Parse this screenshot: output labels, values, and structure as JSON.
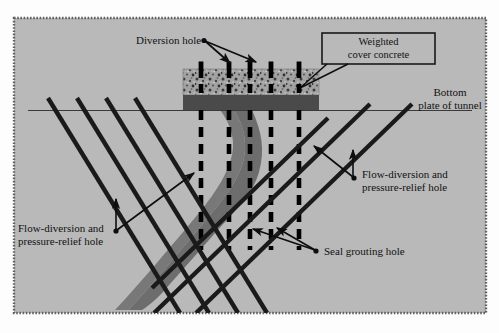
{
  "figure": {
    "background_color": "#b9b9b9",
    "frame_border_color": "#6e6e6e",
    "page_color": "#fdfdfd"
  },
  "labels": {
    "diversion_hole": "Diversion hole",
    "weighted_cover_line1": "Weighted",
    "weighted_cover_line2": "cover concrete",
    "bottom_plate_line1": "Bottom",
    "bottom_plate_line2": "plate of tunnel",
    "flow_right_line1": "Flow-diversion and",
    "flow_right_line2": "pressure-relief hole",
    "flow_left_line1": "Flow-diversion and",
    "flow_left_line2": "pressure-relief hole",
    "seal_grouting_hole": "Seal grouting hole"
  },
  "elements": {
    "concrete_block": {
      "name": "weighted cover concrete",
      "fill_color": "#9e9e9e",
      "speckle_color": "#3b3b3b",
      "x": 183,
      "y": 69,
      "width": 136,
      "height": 26
    },
    "base_slab": {
      "name": "bottom plate of tunnel slab",
      "fill_color": "#4a4a4a",
      "x": 183,
      "y": 95,
      "width": 136,
      "height": 15
    },
    "tunnel_line": {
      "name": "bottom plate of tunnel reference line",
      "color": "#333333",
      "y": 110,
      "x_start": 28,
      "x_end": 472
    },
    "seepage_crack": {
      "name": "seepage crack / water path",
      "fill_color": "#6d6d6d"
    },
    "seal_grouting_holes": {
      "count": 5,
      "color": "#000000",
      "style": "dashed vertical",
      "x_positions": [
        201,
        229,
        250,
        271,
        299
      ],
      "top": 110,
      "bottom": 250
    },
    "diversion_hole_stubs": {
      "count": 5,
      "color": "#000000",
      "x_positions": [
        201,
        229,
        250,
        271,
        299
      ],
      "top": 62,
      "bottom": 69
    },
    "flow_diversion_holes_left": {
      "count": 4,
      "color": "#1a1a1a",
      "direction": "down-right",
      "top_x_positions": [
        48,
        77,
        106,
        135
      ]
    },
    "flow_diversion_holes_right": {
      "count": 3,
      "color": "#1a1a1a",
      "direction": "down-left",
      "top_x_positions": [
        412,
        370,
        328
      ]
    }
  },
  "callout_box": {
    "border_color": "#1a1a1a",
    "fill_color": "#b9b9b9",
    "x": 322,
    "y": 33,
    "width": 113,
    "height": 30
  }
}
